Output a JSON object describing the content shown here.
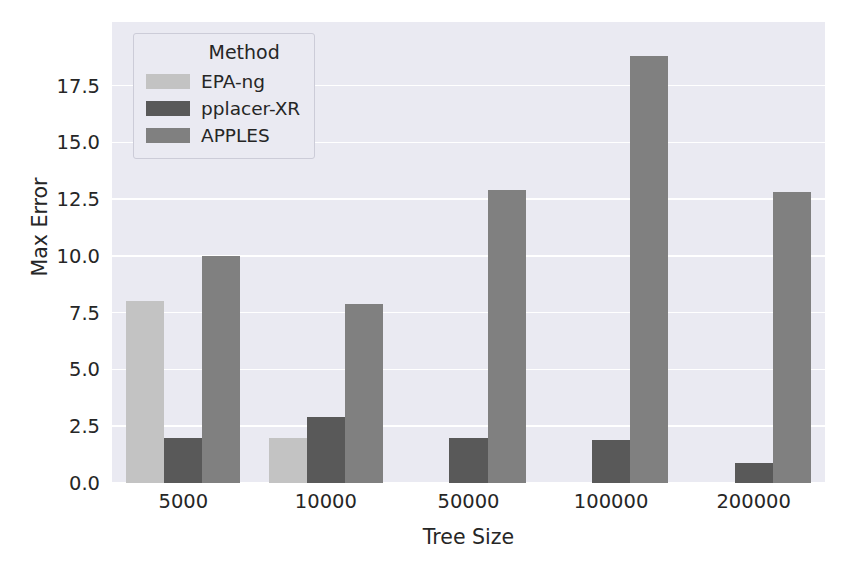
{
  "chart_data": {
    "type": "bar",
    "title": "",
    "subtitle": "",
    "xlabel": "Tree Size",
    "ylabel": "Max Error",
    "categories": [
      "5000",
      "10000",
      "50000",
      "100000",
      "200000"
    ],
    "series": [
      {
        "name": "EPA-ng",
        "color": "#C3C3C3",
        "values": [
          8.0,
          2.0,
          0,
          0,
          0
        ]
      },
      {
        "name": "pplacer-XR",
        "color": "#595959",
        "values": [
          2.0,
          2.9,
          2.0,
          1.9,
          0.9
        ]
      },
      {
        "name": "APPLES",
        "color": "#808080",
        "values": [
          10.0,
          7.9,
          12.9,
          18.8,
          12.8
        ]
      }
    ],
    "ylim": [
      0.0,
      20.3
    ],
    "yticks": [
      0.0,
      2.5,
      5.0,
      7.5,
      10.0,
      12.5,
      15.0,
      17.5
    ],
    "ytick_labels": [
      "0.0",
      "2.5",
      "5.0",
      "7.5",
      "10.0",
      "12.5",
      "15.0",
      "17.5"
    ],
    "grid": true,
    "grid_color": "#FFFFFF",
    "plot_background": "#EAEAF2",
    "figure_background": "#FFFFFF",
    "legend": {
      "title": "Method",
      "position": "upper left",
      "entries": [
        {
          "label": "EPA-ng",
          "color": "#C3C3C3"
        },
        {
          "label": "pplacer-XR",
          "color": "#595959"
        },
        {
          "label": "APPLES",
          "color": "#808080"
        }
      ]
    }
  }
}
